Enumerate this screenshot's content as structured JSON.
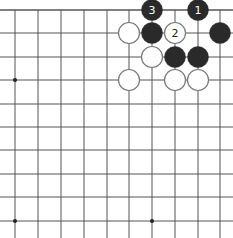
{
  "diagram": {
    "type": "go-board-fragment",
    "colors": {
      "background": "#ffffff",
      "grid": "#555555",
      "black_stone": "#2a2a2a",
      "white_stone": "#ffffff",
      "white_stone_outline": "#777777",
      "black_label": "#ffffff",
      "white_label": "#222222"
    },
    "grid": {
      "x": [
        15,
        38,
        61,
        84,
        107,
        129,
        152,
        175,
        198,
        220
      ],
      "y": [
        10,
        33,
        57,
        80,
        104,
        127,
        150,
        174,
        197,
        221
      ],
      "top_edge": true,
      "right_extends": true,
      "bottom_extends": true,
      "left_extends": true
    },
    "star_points": [
      {
        "col": 0,
        "row": 3
      },
      {
        "col": 0,
        "row": 9
      },
      {
        "col": 6,
        "row": 9
      }
    ],
    "stones": [
      {
        "color": "black",
        "col": 6,
        "row": 0,
        "label": "3"
      },
      {
        "color": "black",
        "col": 8,
        "row": 0,
        "label": "1"
      },
      {
        "color": "white",
        "col": 5,
        "row": 1,
        "label": ""
      },
      {
        "color": "black",
        "col": 6,
        "row": 1,
        "label": ""
      },
      {
        "color": "white",
        "col": 7,
        "row": 1,
        "label": "2"
      },
      {
        "color": "black",
        "col": 9,
        "row": 1,
        "label": ""
      },
      {
        "color": "white",
        "col": 6,
        "row": 2,
        "label": ""
      },
      {
        "color": "black",
        "col": 7,
        "row": 2,
        "label": ""
      },
      {
        "color": "black",
        "col": 8,
        "row": 2,
        "label": ""
      },
      {
        "color": "white",
        "col": 5,
        "row": 3,
        "label": ""
      },
      {
        "color": "white",
        "col": 7,
        "row": 3,
        "label": ""
      },
      {
        "color": "white",
        "col": 8,
        "row": 3,
        "label": ""
      }
    ]
  }
}
